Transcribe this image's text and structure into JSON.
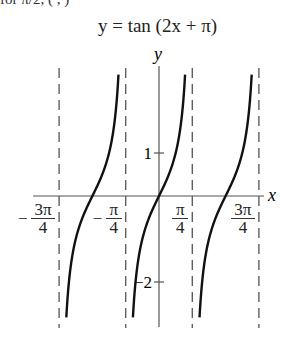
{
  "header": {
    "cutoff_text": "for  π/2,  (      ,      )"
  },
  "chart_data": {
    "type": "line",
    "title": "y = tan (2x + π)",
    "function": "tan(2x + pi)",
    "xlabel": "x",
    "ylabel": "y",
    "x_ticks": [
      {
        "value": -2.356,
        "label": "-3π/4",
        "sign": "−",
        "num": "3π",
        "den": "4"
      },
      {
        "value": -0.785,
        "label": "-π/4",
        "sign": "−",
        "num": "π",
        "den": "4"
      },
      {
        "value": 0.785,
        "label": "π/4",
        "sign": "",
        "num": "π",
        "den": "4"
      },
      {
        "value": 2.356,
        "label": "3π/4",
        "sign": "",
        "num": "3π",
        "den": "4"
      }
    ],
    "y_ticks": [
      {
        "value": 1,
        "label": "1"
      },
      {
        "value": -2,
        "label": "−2"
      }
    ],
    "asymptotes": [
      -2.356,
      -0.785,
      0.785,
      2.356
    ],
    "asymptote_style": "dashed",
    "branches": [
      {
        "center": -1.571,
        "zero_at": "-π/2"
      },
      {
        "center": 0,
        "zero_at": "0"
      },
      {
        "center": 1.571,
        "zero_at": "π/2"
      }
    ],
    "xlim": [
      -2.8,
      2.95
    ],
    "ylim": [
      -3.1,
      3.0
    ],
    "grid": false,
    "legend": null
  }
}
